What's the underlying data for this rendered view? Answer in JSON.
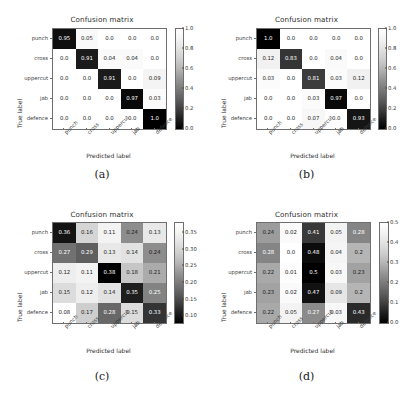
{
  "figure": {
    "background": "#ffffff",
    "classes": [
      "punch",
      "cross",
      "uppercut",
      "jab",
      "defence"
    ],
    "axis_titles": {
      "x": "Predicted label",
      "y": "True label"
    },
    "title": "Confusion matrix"
  },
  "chart_data": [
    {
      "type": "heatmap",
      "panel": "(a)",
      "title": "Confusion matrix",
      "xlabel": "Predicted label",
      "ylabel": "True label",
      "categories": [
        "punch",
        "cross",
        "uppercut",
        "jab",
        "defence"
      ],
      "xtick_labels": [
        "punch",
        "cross",
        "uppercut",
        "jab",
        "defence"
      ],
      "ytick_labels": [
        "punch",
        "cross",
        "uppercut",
        "jab",
        "defence"
      ],
      "values": [
        [
          0.95,
          0.05,
          0.0,
          0.0,
          0.0
        ],
        [
          0.0,
          0.91,
          0.04,
          0.04,
          0.0
        ],
        [
          0.0,
          0.0,
          0.91,
          0.0,
          0.09
        ],
        [
          0.0,
          0.0,
          0.0,
          0.97,
          0.03
        ],
        [
          0.0,
          0.0,
          0.0,
          0.0,
          1.0
        ]
      ],
      "cell_labels": [
        [
          "0.95",
          "0.05",
          "0.0",
          "0.0",
          "0.0"
        ],
        [
          "0.0",
          "0.91",
          "0.04",
          "0.04",
          "0.0"
        ],
        [
          "0.0",
          "0.0",
          "0.91",
          "0.0",
          "0.09"
        ],
        [
          "0.0",
          "0.0",
          "0.0",
          "0.97",
          "0.03"
        ],
        [
          "0.0",
          "0.0",
          "0.0",
          "0.0",
          "1.0"
        ]
      ],
      "colorbar": {
        "vmin": 0.0,
        "vmax": 1.0,
        "ticks": [
          "1.0",
          "0.8",
          "0.6",
          "0.4",
          "0.2",
          "0.0"
        ],
        "tick_values": [
          1.0,
          0.8,
          0.6,
          0.4,
          0.2,
          0.0
        ]
      },
      "cmap": "greys",
      "grid": false,
      "legend": "colorbar-right"
    },
    {
      "type": "heatmap",
      "panel": "(b)",
      "title": "Confusion matrix",
      "xlabel": "Predicted label",
      "ylabel": "True label",
      "categories": [
        "punch",
        "cross",
        "uppercut",
        "jab",
        "defence"
      ],
      "xtick_labels": [
        "punch",
        "cross",
        "uppercut",
        "jab",
        "defence"
      ],
      "ytick_labels": [
        "punch",
        "cross",
        "uppercut",
        "jab",
        "defence"
      ],
      "values": [
        [
          1.0,
          0.0,
          0.0,
          0.0,
          0.0
        ],
        [
          0.12,
          0.83,
          0.0,
          0.04,
          0.0
        ],
        [
          0.03,
          0.0,
          0.81,
          0.03,
          0.12
        ],
        [
          0.0,
          0.0,
          0.03,
          0.97,
          0.0
        ],
        [
          0.0,
          0.0,
          0.07,
          0.0,
          0.93
        ]
      ],
      "cell_labels": [
        [
          "1.0",
          "0.0",
          "0.0",
          "0.0",
          "0.0"
        ],
        [
          "0.12",
          "0.83",
          "0.0",
          "0.04",
          "0.0"
        ],
        [
          "0.03",
          "0.0",
          "0.81",
          "0.03",
          "0.12"
        ],
        [
          "0.0",
          "0.0",
          "0.03",
          "0.97",
          "0.0"
        ],
        [
          "0.0",
          "0.0",
          "0.07",
          "0.0",
          "0.93"
        ]
      ],
      "colorbar": {
        "vmin": 0.0,
        "vmax": 1.0,
        "ticks": [
          "1.0",
          "0.8",
          "0.6",
          "0.4",
          "0.2",
          "0.0"
        ],
        "tick_values": [
          1.0,
          0.8,
          0.6,
          0.4,
          0.2,
          0.0
        ]
      },
      "cmap": "greys",
      "grid": false,
      "legend": "colorbar-right"
    },
    {
      "type": "heatmap",
      "panel": "(c)",
      "title": "Confusion matrix",
      "xlabel": "Predicted label",
      "ylabel": "True label",
      "categories": [
        "punch",
        "cross",
        "uppercut",
        "jab",
        "defence"
      ],
      "xtick_labels": [
        "punch",
        "cross",
        "uppercut",
        "jab",
        "defence"
      ],
      "ytick_labels": [
        "punch",
        "cross",
        "uppercut",
        "jab",
        "defence"
      ],
      "values": [
        [
          0.36,
          0.16,
          0.11,
          0.24,
          0.13
        ],
        [
          0.27,
          0.29,
          0.13,
          0.14,
          0.24
        ],
        [
          0.12,
          0.11,
          0.38,
          0.18,
          0.21
        ],
        [
          0.15,
          0.12,
          0.14,
          0.35,
          0.25
        ],
        [
          0.08,
          0.17,
          0.28,
          0.15,
          0.33
        ]
      ],
      "cell_labels": [
        [
          "0.36",
          "0.16",
          "0.11",
          "0.24",
          "0.13"
        ],
        [
          "0.27",
          "0.29",
          "0.13",
          "0.14",
          "0.24"
        ],
        [
          "0.12",
          "0.11",
          "0.38",
          "0.18",
          "0.21"
        ],
        [
          "0.15",
          "0.12",
          "0.14",
          "0.35",
          "0.25"
        ],
        [
          "0.08",
          "0.17",
          "0.28",
          "0.15",
          "0.33"
        ]
      ],
      "colorbar": {
        "vmin": 0.08,
        "vmax": 0.38,
        "ticks": [
          "0.35",
          "0.30",
          "0.25",
          "0.20",
          "0.15",
          "0.10"
        ],
        "tick_values": [
          0.35,
          0.3,
          0.25,
          0.2,
          0.15,
          0.1
        ]
      },
      "cmap": "greys",
      "grid": false,
      "legend": "colorbar-right"
    },
    {
      "type": "heatmap",
      "panel": "(d)",
      "title": "Confusion matrix",
      "xlabel": "Predicted label",
      "ylabel": "True label",
      "categories": [
        "punch",
        "cross",
        "uppercut",
        "jab",
        "defence"
      ],
      "xtick_labels": [
        "punch",
        "cross",
        "uppercut",
        "jab",
        "defence"
      ],
      "ytick_labels": [
        "punch",
        "cross",
        "uppercut",
        "jab",
        "defence"
      ],
      "values": [
        [
          0.24,
          0.02,
          0.41,
          0.05,
          0.28
        ],
        [
          0.28,
          0.0,
          0.48,
          0.04,
          0.2
        ],
        [
          0.22,
          0.01,
          0.5,
          0.03,
          0.23
        ],
        [
          0.23,
          0.02,
          0.47,
          0.09,
          0.2
        ],
        [
          0.22,
          0.05,
          0.27,
          0.03,
          0.43
        ]
      ],
      "cell_labels": [
        [
          "0.24",
          "0.02",
          "0.41",
          "0.05",
          "0.28"
        ],
        [
          "0.28",
          "0.0",
          "0.48",
          "0.04",
          "0.2"
        ],
        [
          "0.22",
          "0.01",
          "0.5",
          "0.03",
          "0.23"
        ],
        [
          "0.23",
          "0.02",
          "0.47",
          "0.09",
          "0.2"
        ],
        [
          "0.22",
          "0.05",
          "0.27",
          "0.03",
          "0.43"
        ]
      ],
      "colorbar": {
        "vmin": 0.0,
        "vmax": 0.5,
        "ticks": [
          "0.5",
          "0.4",
          "0.3",
          "0.2",
          "0.1",
          "0.0"
        ],
        "tick_values": [
          0.5,
          0.4,
          0.3,
          0.2,
          0.1,
          0.0
        ]
      },
      "cmap": "greys",
      "grid": false,
      "legend": "colorbar-right"
    }
  ],
  "panel_letters": [
    "(a)",
    "(b)",
    "(c)",
    "(d)"
  ]
}
